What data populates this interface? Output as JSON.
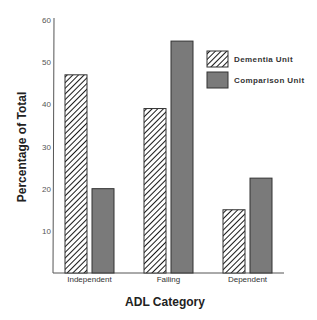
{
  "chart_data": {
    "type": "bar",
    "title": "",
    "xlabel": "ADL Category",
    "ylabel": "Percentage of Total",
    "categories": [
      "Independent",
      "Failing",
      "Dependent"
    ],
    "series": [
      {
        "name": "Dementia Unit",
        "values": [
          47,
          39,
          15
        ],
        "fill": "hatch"
      },
      {
        "name": "Comparison Unit",
        "values": [
          20,
          55,
          22.5
        ],
        "fill": "#7a7a7a"
      }
    ],
    "ylim": [
      0,
      60
    ],
    "yticks": [
      10,
      20,
      30,
      40,
      50,
      60
    ],
    "grid": false,
    "legend": "top-right"
  },
  "colors": {
    "axis": "#555555",
    "hatch_line": "#1a1a1a",
    "comparison_fill": "#7a7a7a",
    "bar_border": "#333333"
  }
}
